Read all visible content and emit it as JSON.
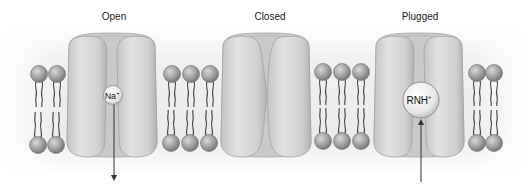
{
  "diagram": {
    "states": [
      {
        "label": "Open",
        "ion": "Na",
        "ion_charge": "+",
        "arrow": "down"
      },
      {
        "label": "Closed"
      },
      {
        "label": "Plugged",
        "ion": "RNH",
        "ion_charge": "+",
        "arrow": "up"
      }
    ],
    "colors": {
      "background_shade": "#e6e6e6",
      "protein": "#cfcfcf",
      "protein_dark": "#a9a9a9",
      "lipid_head": "#9a9a9a",
      "lipid_tail": "#555555",
      "arrow": "#333333"
    }
  }
}
